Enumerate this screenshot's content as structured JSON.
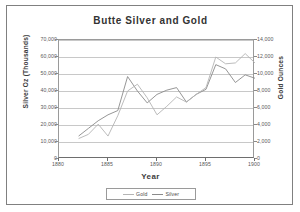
{
  "chart_data": {
    "type": "line",
    "title": "Butte Silver and Gold",
    "xlabel": "Year",
    "ylabel": "Silver Oz (Thousands)",
    "ylabel_right": "Gold Ounces",
    "grid": true,
    "legend_position": "bottom",
    "xlim": [
      1880,
      1900
    ],
    "ylim": [
      0,
      70000
    ],
    "ylim_right": [
      0,
      14000
    ],
    "xticks": [
      "1880",
      "1885",
      "1890",
      "1895",
      "1900"
    ],
    "yticks": [
      "0",
      "10,000",
      "20,000",
      "30,000",
      "40,000",
      "50,000",
      "60,000",
      "70,000"
    ],
    "yticks_right": [
      "0",
      "2,000",
      "4,000",
      "6,000",
      "8,000",
      "10,000",
      "12,000",
      "14,000"
    ],
    "x": [
      1882,
      1883,
      1884,
      1885,
      1886,
      1887,
      1888,
      1889,
      1890,
      1891,
      1892,
      1893,
      1894,
      1895,
      1896,
      1897,
      1898,
      1899,
      1900
    ],
    "series": [
      {
        "name": "Silver",
        "axis": "left",
        "units": "thousands of ounces",
        "color": "#8a8a8a",
        "values": [
          13500,
          18000,
          22500,
          26000,
          28500,
          48500,
          40000,
          33000,
          38000,
          40500,
          42000,
          33500,
          38000,
          41000,
          55500,
          53000,
          45000,
          49500,
          47500
        ]
      },
      {
        "name": "Gold",
        "axis": "right",
        "units": "ounces",
        "color": "#b4b4b4",
        "values": [
          2400,
          2900,
          4100,
          2700,
          5100,
          8000,
          8800,
          7200,
          5200,
          6200,
          7300,
          6700,
          7600,
          8400,
          12000,
          11200,
          11300,
          12400,
          11300
        ]
      }
    ]
  },
  "legend": {
    "items": [
      {
        "label": "Gold",
        "color": "#b4b4b4"
      },
      {
        "label": "Silver",
        "color": "#8a8a8a"
      }
    ]
  }
}
